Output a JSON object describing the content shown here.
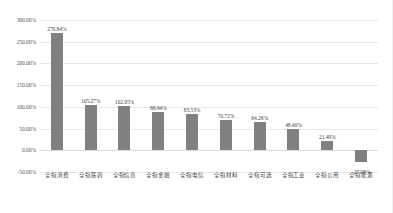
{
  "chart_data": {
    "type": "bar",
    "title": "",
    "subtitle": "",
    "xlabel": "",
    "ylabel": "",
    "ylim": [
      -50,
      300
    ],
    "ytick_step": 50,
    "grid": true,
    "legend": false,
    "legend_position": "none",
    "value_suffix": "%",
    "bar_color": "#808080",
    "gridline_color": "#e8e8e8",
    "categories": [
      "全指消费",
      "全指医药",
      "全指信息",
      "全指金融",
      "全指电信",
      "全指材料",
      "全指可选",
      "全指工业",
      "全指公用",
      "全指能源"
    ],
    "values": [
      270.84,
      105.27,
      102.05,
      88.94,
      83.53,
      70.72,
      64.26,
      48.4,
      21.49,
      -27.08
    ],
    "data_labels": [
      "270.84%",
      "105.27%",
      "102.05%",
      "88.94%",
      "83.53%",
      "70.72%",
      "64.26%",
      "48.40%",
      "21.49%",
      "-27.08%"
    ],
    "ytick_labels": [
      "300.00%",
      "250.00%",
      "200.00%",
      "150.00%",
      "100.00%",
      "50.00%",
      "0.00%",
      "-50.00%"
    ],
    "ytick_values": [
      300,
      250,
      200,
      150,
      100,
      50,
      0,
      -50
    ]
  }
}
